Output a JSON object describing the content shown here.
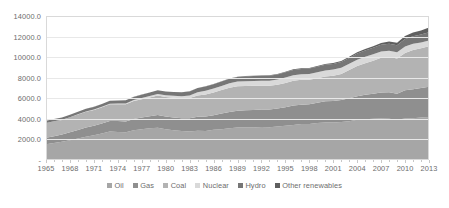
{
  "chart_data": {
    "type": "area",
    "title": "",
    "subtitle": "",
    "xlabel": "",
    "ylabel": "",
    "stacked": true,
    "grid": true,
    "legend_position": "bottom",
    "ylim": [
      0,
      14000
    ],
    "yticks": [
      "-",
      "2000.0",
      "4000.0",
      "6000.0",
      "8000.0",
      "10000.0",
      "12000.0",
      "14000.0"
    ],
    "ytick_values": [
      0,
      2000,
      4000,
      6000,
      8000,
      10000,
      12000,
      14000
    ],
    "xlim": [
      1965,
      2013
    ],
    "categories": [
      1965,
      1966,
      1967,
      1968,
      1969,
      1970,
      1971,
      1972,
      1973,
      1974,
      1975,
      1976,
      1977,
      1978,
      1979,
      1980,
      1981,
      1982,
      1983,
      1984,
      1985,
      1986,
      1987,
      1988,
      1989,
      1990,
      1991,
      1992,
      1993,
      1994,
      1995,
      1996,
      1997,
      1998,
      1999,
      2000,
      2001,
      2002,
      2003,
      2004,
      2005,
      2006,
      2007,
      2008,
      2009,
      2010,
      2011,
      2012,
      2013
    ],
    "xticks": [
      "1965",
      "1968",
      "1971",
      "1974",
      "1977",
      "1980",
      "1983",
      "1986",
      "1989",
      "1992",
      "1995",
      "1998",
      "2001",
      "2004",
      "2007",
      "2010",
      "2013"
    ],
    "xtick_values": [
      1965,
      1968,
      1971,
      1974,
      1977,
      1980,
      1983,
      1986,
      1989,
      1992,
      1995,
      1998,
      2001,
      2004,
      2007,
      2010,
      2013
    ],
    "series": [
      {
        "name": "Oil",
        "color": "#a6a6a6",
        "values": [
          1530,
          1650,
          1770,
          1920,
          2080,
          2260,
          2400,
          2570,
          2760,
          2730,
          2700,
          2890,
          2990,
          3090,
          3130,
          3000,
          2890,
          2810,
          2780,
          2840,
          2820,
          2930,
          3000,
          3090,
          3150,
          3160,
          3170,
          3200,
          3190,
          3260,
          3320,
          3410,
          3490,
          3510,
          3600,
          3640,
          3650,
          3690,
          3770,
          3910,
          3970,
          4000,
          4040,
          4010,
          3920,
          4040,
          4070,
          4120,
          4180
        ]
      },
      {
        "name": "Gas",
        "color": "#8f8f8f",
        "values": [
          630,
          670,
          710,
          770,
          830,
          890,
          940,
          990,
          1030,
          1050,
          1040,
          1100,
          1130,
          1170,
          1240,
          1240,
          1250,
          1260,
          1270,
          1370,
          1400,
          1430,
          1510,
          1580,
          1640,
          1670,
          1700,
          1710,
          1730,
          1750,
          1810,
          1890,
          1890,
          1920,
          1970,
          2060,
          2090,
          2150,
          2230,
          2300,
          2370,
          2430,
          2530,
          2580,
          2520,
          2740,
          2810,
          2870,
          2950
        ]
      },
      {
        "name": "Coal",
        "color": "#b3b3b3",
        "values": [
          1440,
          1440,
          1420,
          1460,
          1510,
          1540,
          1530,
          1570,
          1630,
          1640,
          1670,
          1740,
          1790,
          1810,
          1900,
          1890,
          1900,
          1920,
          1970,
          2070,
          2160,
          2210,
          2290,
          2350,
          2380,
          2370,
          2340,
          2310,
          2290,
          2300,
          2360,
          2400,
          2410,
          2380,
          2380,
          2420,
          2450,
          2520,
          2750,
          2920,
          3070,
          3210,
          3360,
          3420,
          3430,
          3630,
          3820,
          3870,
          3930
        ]
      },
      {
        "name": "Nuclear",
        "color": "#d9d9d9",
        "values": [
          6,
          8,
          12,
          17,
          21,
          25,
          32,
          42,
          50,
          66,
          86,
          100,
          125,
          145,
          155,
          170,
          200,
          215,
          250,
          300,
          350,
          370,
          400,
          430,
          450,
          460,
          480,
          485,
          500,
          510,
          525,
          540,
          540,
          545,
          570,
          585,
          600,
          610,
          600,
          625,
          630,
          635,
          620,
          620,
          615,
          630,
          600,
          560,
          565
        ]
      },
      {
        "name": "Hydro",
        "color": "#767676",
        "values": [
          210,
          218,
          228,
          238,
          248,
          258,
          262,
          272,
          280,
          298,
          308,
          305,
          320,
          338,
          348,
          358,
          368,
          375,
          395,
          408,
          415,
          425,
          430,
          445,
          450,
          465,
          470,
          465,
          490,
          490,
          505,
          520,
          525,
          530,
          540,
          555,
          545,
          560,
          570,
          595,
          610,
          630,
          645,
          670,
          675,
          720,
          740,
          770,
          800
        ]
      },
      {
        "name": "Other renewables",
        "color": "#5f5f5f",
        "values": [
          1,
          1,
          1,
          2,
          2,
          3,
          3,
          4,
          5,
          6,
          7,
          8,
          9,
          10,
          11,
          12,
          14,
          15,
          17,
          19,
          21,
          23,
          25,
          27,
          30,
          33,
          36,
          39,
          43,
          47,
          52,
          57,
          63,
          69,
          76,
          84,
          92,
          102,
          113,
          127,
          143,
          163,
          188,
          219,
          250,
          295,
          345,
          400,
          465
        ]
      }
    ]
  },
  "legend": {
    "items": [
      {
        "label": "Oil"
      },
      {
        "label": "Gas"
      },
      {
        "label": "Coal"
      },
      {
        "label": "Nuclear"
      },
      {
        "label": "Hydro"
      },
      {
        "label": "Other renewables"
      }
    ]
  }
}
